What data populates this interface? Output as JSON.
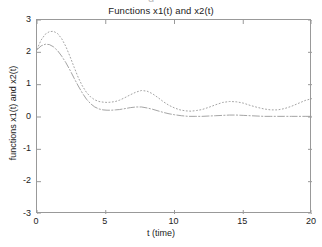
{
  "figure": {
    "background_color": "#ffffff",
    "axis_color": "#999999",
    "text_color": "#222222",
    "top_artifact_text": "g"
  },
  "chart_data": {
    "type": "line",
    "title": "Functions x1(t) and x2(t)",
    "xlabel": "t (time)",
    "ylabel": "functions x1(t) and x2(t)",
    "xlim": [
      0,
      20
    ],
    "ylim": [
      -3,
      3
    ],
    "xticks": [
      0,
      5,
      10,
      15,
      20
    ],
    "yticks": [
      3,
      2,
      1,
      0,
      -1,
      -2,
      -3
    ],
    "xtick_labels": [
      "0",
      "5",
      "10",
      "15",
      "20"
    ],
    "ytick_labels": [
      "3",
      "2",
      "1",
      "0",
      "-1",
      "-2",
      "-3"
    ],
    "grid": false,
    "legend": null,
    "legend_position": "none",
    "series": [
      {
        "name": "x1(t)",
        "linestyle": "dotted",
        "color": "#9a9a9a",
        "x": [
          0.0,
          0.3,
          0.6,
          0.9,
          1.2,
          1.5,
          1.8,
          2.1,
          2.4,
          2.7,
          3.0,
          3.3,
          3.6,
          3.9,
          4.2,
          4.5,
          4.8,
          5.1,
          5.4,
          5.7,
          6.0,
          6.4,
          6.8,
          7.2,
          7.6,
          8.0,
          8.4,
          8.8,
          9.2,
          9.6,
          10.0,
          10.4,
          10.8,
          11.2,
          11.6,
          12.0,
          12.5,
          13.0,
          13.5,
          14.0,
          14.5,
          15.0,
          15.5,
          16.0,
          16.5,
          17.0,
          17.5,
          18.0,
          18.5,
          19.0,
          19.5,
          20.0
        ],
        "y": [
          2.1,
          2.38,
          2.56,
          2.64,
          2.65,
          2.58,
          2.42,
          2.18,
          1.87,
          1.54,
          1.22,
          0.96,
          0.76,
          0.62,
          0.53,
          0.48,
          0.46,
          0.45,
          0.46,
          0.48,
          0.52,
          0.6,
          0.69,
          0.77,
          0.82,
          0.8,
          0.72,
          0.6,
          0.47,
          0.36,
          0.28,
          0.22,
          0.19,
          0.18,
          0.2,
          0.23,
          0.3,
          0.38,
          0.45,
          0.48,
          0.47,
          0.43,
          0.36,
          0.3,
          0.25,
          0.22,
          0.22,
          0.26,
          0.33,
          0.42,
          0.51,
          0.57
        ]
      },
      {
        "name": "x2(t)",
        "linestyle": "dashdot",
        "color": "#9a9a9a",
        "x": [
          0.0,
          0.3,
          0.6,
          0.9,
          1.2,
          1.5,
          1.8,
          2.1,
          2.4,
          2.7,
          3.0,
          3.3,
          3.6,
          3.9,
          4.2,
          4.5,
          4.8,
          5.1,
          5.4,
          5.7,
          6.0,
          6.4,
          6.8,
          7.2,
          7.6,
          8.0,
          8.4,
          8.8,
          9.2,
          9.6,
          10.0,
          10.5,
          11.0,
          11.5,
          12.0,
          12.5,
          13.0,
          13.5,
          14.0,
          14.5,
          15.0,
          15.5,
          16.0,
          16.5,
          17.0,
          17.5,
          18.0,
          18.5,
          19.0,
          19.5,
          20.0
        ],
        "y": [
          2.08,
          2.2,
          2.25,
          2.24,
          2.17,
          2.05,
          1.88,
          1.68,
          1.45,
          1.2,
          0.96,
          0.74,
          0.55,
          0.41,
          0.31,
          0.25,
          0.22,
          0.21,
          0.21,
          0.22,
          0.23,
          0.26,
          0.29,
          0.31,
          0.31,
          0.28,
          0.24,
          0.19,
          0.14,
          0.1,
          0.07,
          0.04,
          0.02,
          0.02,
          0.02,
          0.03,
          0.04,
          0.05,
          0.06,
          0.06,
          0.05,
          0.04,
          0.03,
          0.02,
          0.02,
          0.02,
          0.02,
          0.02,
          0.02,
          0.02,
          0.02
        ]
      }
    ]
  }
}
